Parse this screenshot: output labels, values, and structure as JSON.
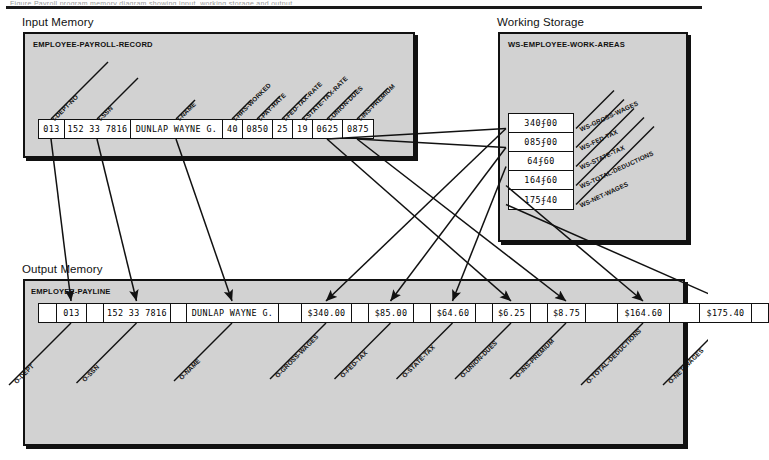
{
  "page": {
    "top_cut_text": "Figure    Payroll program memory diagram showing input, working storage and output"
  },
  "sections": {
    "input": {
      "caption": "Input Memory",
      "record_name": "EMPLOYEE-PAYROLL-RECORD",
      "fields": [
        {
          "label": "I-DEPT-NO",
          "value": "013",
          "width": 26
        },
        {
          "label": "I-SSN",
          "value": "152 33 7816",
          "width": 66
        },
        {
          "label": "I-NAME",
          "value": "DUNLAP WAYNE G.",
          "width": 92
        },
        {
          "label": "I-HRS-WORKED",
          "value": "40",
          "width": 20
        },
        {
          "label": "I-PAY-RATE",
          "value": "0850",
          "width": 30
        },
        {
          "label": "I-FED-TAX-RATE",
          "value": "25",
          "width": 20
        },
        {
          "label": "I-STATE-TAX-RATE",
          "value": "19",
          "width": 20
        },
        {
          "label": "I-UNION-DUES",
          "value": "0625",
          "width": 30
        },
        {
          "label": "I-INS-PREMIUM",
          "value": "0875",
          "width": 30
        }
      ]
    },
    "working_storage": {
      "caption": "Working Storage",
      "record_name": "WS-EMPLOYEE-WORK-AREAS",
      "fields": [
        {
          "label": "WS-GROSS-WAGES",
          "value": "340ʄ00"
        },
        {
          "label": "WS-FED-TAX",
          "value": "085ʄ00"
        },
        {
          "label": "WS-STATE-TAX",
          "value": "64ʄ60"
        },
        {
          "label": "WS-TOTAL-DEDUCTIONS",
          "value": "164ʄ60"
        },
        {
          "label": "WS-NET-WAGES",
          "value": "175ʄ40"
        }
      ]
    },
    "output": {
      "caption": "Output Memory",
      "record_name": "EMPLOYEE-PAYLINE",
      "fields": [
        {
          "label": "",
          "value": "",
          "width": 18,
          "blank": true
        },
        {
          "label": "O-DEPT",
          "value": "013",
          "width": 30
        },
        {
          "label": "",
          "value": "",
          "width": 17,
          "blank": true
        },
        {
          "label": "O-SSN",
          "value": "152 33 7816",
          "width": 67
        },
        {
          "label": "",
          "value": "",
          "width": 16,
          "blank": true
        },
        {
          "label": "O-NAME",
          "value": "DUNLAP WAYNE G.",
          "width": 92
        },
        {
          "label": "",
          "value": "",
          "width": 23,
          "blank": true
        },
        {
          "label": "O-GROSS-WAGES",
          "value": "$340.00",
          "width": 50
        },
        {
          "label": "",
          "value": "",
          "width": 17,
          "blank": true
        },
        {
          "label": "O-FED-TAX",
          "value": "$85.00",
          "width": 45
        },
        {
          "label": "",
          "value": "",
          "width": 17,
          "blank": true
        },
        {
          "label": "O-STATE-TAX",
          "value": "$64.60",
          "width": 45
        },
        {
          "label": "",
          "value": "",
          "width": 17,
          "blank": true
        },
        {
          "label": "O-UNION-DUES",
          "value": "$6.25",
          "width": 38
        },
        {
          "label": "",
          "value": "",
          "width": 17,
          "blank": true
        },
        {
          "label": "O-INS-PREMIUM",
          "value": "$8.75",
          "width": 38
        },
        {
          "label": "",
          "value": "",
          "width": 32,
          "blank": true
        },
        {
          "label": "O-TOTAL-DEDUCTIONS",
          "value": "$164.60",
          "width": 52
        },
        {
          "label": "",
          "value": "",
          "width": 30,
          "blank": true
        },
        {
          "label": "O-NET-WAGES",
          "value": "$175.40",
          "width": 52
        },
        {
          "label": "",
          "value": "",
          "width": 16,
          "blank": true
        }
      ]
    }
  },
  "colors": {
    "panel_fill": "#d2d2d2",
    "outline": "#111111",
    "cell_fill": "#ffffff",
    "page_bg": "#ffffff"
  }
}
